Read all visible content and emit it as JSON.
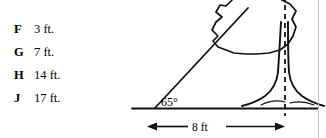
{
  "question": {
    "choices": [
      {
        "letter": "F",
        "value": "3 ft."
      },
      {
        "letter": "G",
        "value": "7 ft."
      },
      {
        "letter": "H",
        "value": "14 ft."
      },
      {
        "letter": "J",
        "value": "17 ft."
      }
    ]
  },
  "diagram": {
    "type": "right-triangle-tree-height",
    "angle_label": "65°",
    "base_label": "8 ft",
    "ground_line": "horizontal-ground",
    "vertical_dashed_line": "tree-center-axis",
    "hypotenuse": "line-of-sight",
    "stroke_color": "#000000",
    "background_color": "#ffffff",
    "border_color": "#c9c9c9"
  }
}
